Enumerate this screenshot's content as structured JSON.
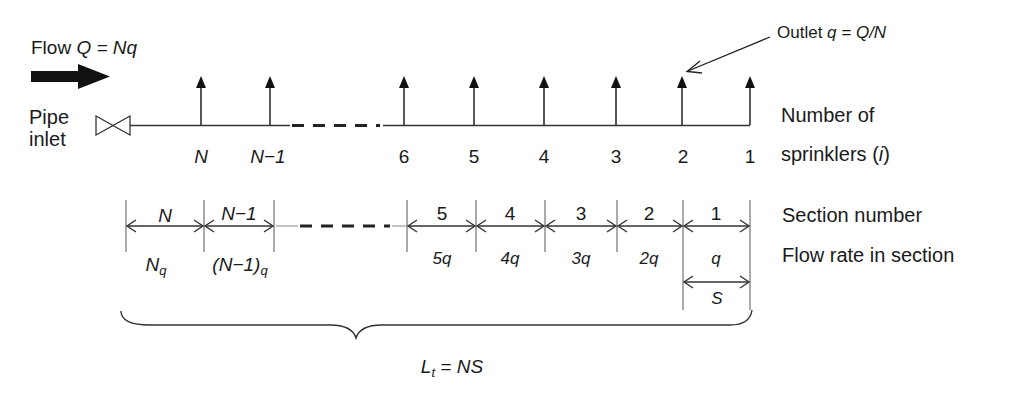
{
  "flow": {
    "label_prefix": "Flow ",
    "label_expr": "Q = Nq"
  },
  "inlet": {
    "line1": "Pipe",
    "line2": "inlet"
  },
  "outlet": {
    "label_prefix": "Outlet ",
    "label_expr": "q = Q/N"
  },
  "sprinklers": {
    "row_label_line1": "Number of",
    "row_label_line2_prefix": "sprinklers (",
    "row_label_var": "i",
    "row_label_line2_suffix": ")",
    "items": [
      {
        "label": "N",
        "italic": true
      },
      {
        "label": "N−1",
        "italic": true
      },
      {
        "label": "6",
        "italic": false
      },
      {
        "label": "5",
        "italic": false
      },
      {
        "label": "4",
        "italic": false
      },
      {
        "label": "3",
        "italic": false
      },
      {
        "label": "2",
        "italic": false
      },
      {
        "label": "1",
        "italic": false
      }
    ]
  },
  "sections": {
    "row_label": "Section number",
    "flow_row_label": "Flow rate in section",
    "items": [
      {
        "number": "N",
        "flow": "N",
        "flow_sub": "q"
      },
      {
        "number": "N−1",
        "flow": "(N−1)",
        "flow_sub": "q"
      },
      {
        "number": "5",
        "flow": "5q",
        "flow_sub": ""
      },
      {
        "number": "4",
        "flow": "4q",
        "flow_sub": ""
      },
      {
        "number": "3",
        "flow": "3q",
        "flow_sub": ""
      },
      {
        "number": "2",
        "flow": "2q",
        "flow_sub": ""
      },
      {
        "number": "1",
        "flow": "q",
        "flow_sub": ""
      }
    ],
    "spacing_label": "S"
  },
  "total_length": {
    "lhs": "L",
    "lhs_sub": "t",
    "rhs": " = NS"
  }
}
